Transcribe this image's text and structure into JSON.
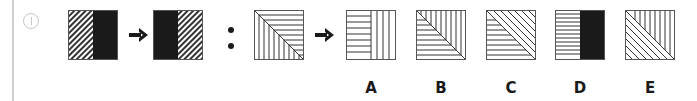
{
  "question": {
    "icon": "info-circle-icon",
    "premise_left": {
      "description": "Square split vertically: left half diagonal hatching, right half solid black"
    },
    "premise_right": {
      "description": "Square split vertically: left half solid black, right half diagonal hatching"
    },
    "separator": ":",
    "query": {
      "description": "Square split by diagonal: upper-right triangle horizontal lines, lower-left triangle vertical lines"
    },
    "arrow_icon": "arrow-right-icon"
  },
  "options": [
    {
      "label": "A",
      "description": "Left half horizontal lines, right half vertical lines"
    },
    {
      "label": "B",
      "description": "Diagonal split: upper-right vertical lines, lower-left horizontal lines"
    },
    {
      "label": "C",
      "description": "Diagonal split: upper-right diagonal lines, lower-left horizontal lines"
    },
    {
      "label": "D",
      "description": "Left half horizontal lines, right half solid black"
    },
    {
      "label": "E",
      "description": "Diagonal split: upper-right vertical lines, lower-left diagonal lines"
    }
  ],
  "colors": {
    "ink": "#1a1a1a",
    "frame": "#555555",
    "bar": "#cfcfcf"
  }
}
